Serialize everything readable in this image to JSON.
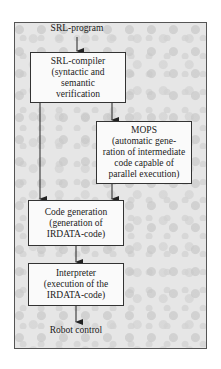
{
  "diagram": {
    "input_label": "SRL-program",
    "output_label": "Robot control",
    "nodes": [
      {
        "id": "srl-compiler",
        "lines": [
          "SRL-compiler",
          "(syntactic and",
          "semantic",
          "verification"
        ]
      },
      {
        "id": "mops",
        "lines": [
          "MOPS",
          "(automatic gene-",
          "ration of intermediate",
          "code capable of",
          "parallel execution)"
        ]
      },
      {
        "id": "code-generation",
        "lines": [
          "Code generation",
          "(generation of",
          "IRDATA-code)"
        ]
      },
      {
        "id": "interpreter",
        "lines": [
          "Interpreter",
          "(execution of the",
          "IRDATA-code)"
        ]
      }
    ],
    "edges": [
      {
        "from": "SRL-program",
        "to": "srl-compiler"
      },
      {
        "from": "srl-compiler",
        "to": "mops"
      },
      {
        "from": "srl-compiler",
        "to": "code-generation"
      },
      {
        "from": "mops",
        "to": "code-generation"
      },
      {
        "from": "code-generation",
        "to": "interpreter"
      },
      {
        "from": "interpreter",
        "to": "Robot control"
      }
    ]
  }
}
